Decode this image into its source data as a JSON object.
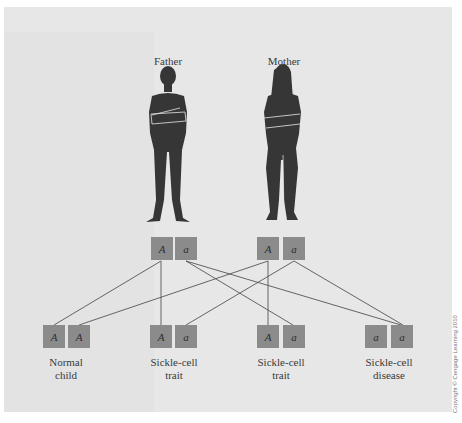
{
  "parents": [
    {
      "label": "Father",
      "alleles": [
        "A",
        "a"
      ]
    },
    {
      "label": "Mother",
      "alleles": [
        "A",
        "a"
      ]
    }
  ],
  "children": [
    {
      "label_line1": "Normal",
      "label_line2": "child",
      "alleles": [
        "A",
        "A"
      ]
    },
    {
      "label_line1": "Sickle-cell",
      "label_line2": "trait",
      "alleles": [
        "A",
        "a"
      ]
    },
    {
      "label_line1": "Sickle-cell",
      "label_line2": "trait",
      "alleles": [
        "A",
        "a"
      ]
    },
    {
      "label_line1": "Sickle-cell",
      "label_line2": "disease",
      "alleles": [
        "a",
        "a"
      ]
    }
  ],
  "copyright": "Copyright © Cengage Learning 2010",
  "colors": {
    "panel": "#e7e7e7",
    "silhouette": "#363636",
    "allele_box": "#8b8b8b",
    "line": "#555555"
  }
}
